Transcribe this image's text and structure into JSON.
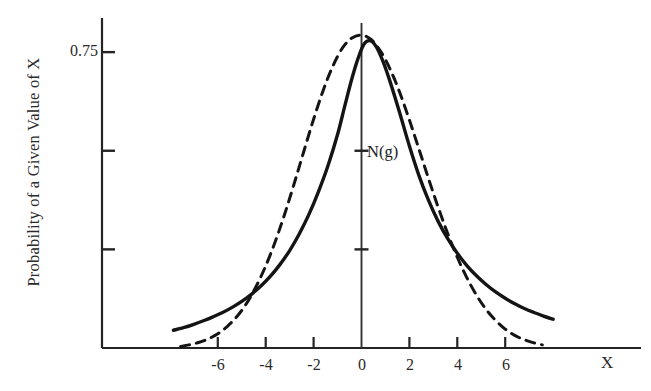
{
  "figure": {
    "background": "#ffffff",
    "ink_color": "#141414"
  },
  "chart_data": {
    "type": "line",
    "title": "",
    "subtitle": "",
    "xlabel": "X",
    "ylabel": "Probability of a Given Value of X",
    "xlim": [
      -7.9,
      11.6
    ],
    "ylim": [
      0,
      0.855
    ],
    "grid": false,
    "legend_position": "none",
    "annotations": [
      {
        "text": "N(g)",
        "x": 0.25,
        "y": 0.495
      }
    ],
    "x_ticks": [
      -6,
      -4,
      -2,
      0,
      2,
      4,
      6
    ],
    "x_tick_labels": [
      "-6",
      "-4",
      "-2",
      "0",
      "2",
      "4",
      "6"
    ],
    "y_ticks": [
      0.25,
      0.5,
      0.75
    ],
    "y_tick_labels": [
      "",
      "",
      "0.75"
    ],
    "y_axis_inner_ticks": [
      0.25,
      0.5,
      0.75
    ],
    "series": [
      {
        "name": "N(g)",
        "style": "solid",
        "color": "#141414",
        "width": 3.4,
        "x": [
          -7.85,
          -7.4,
          -7.0,
          -6.6,
          -6.2,
          -5.8,
          -5.4,
          -5.0,
          -4.6,
          -4.2,
          -3.8,
          -3.4,
          -3.0,
          -2.6,
          -2.2,
          -1.8,
          -1.4,
          -1.0,
          -0.7,
          -0.4,
          -0.15,
          0.1,
          0.35,
          0.6,
          0.9,
          1.2,
          1.6,
          2.0,
          2.4,
          2.8,
          3.2,
          3.6,
          4.0,
          4.4,
          4.8,
          5.2,
          5.6,
          6.0,
          6.4,
          6.8,
          7.2,
          7.6,
          8.0
        ],
        "y": [
          0.045,
          0.052,
          0.06,
          0.069,
          0.079,
          0.09,
          0.103,
          0.118,
          0.136,
          0.157,
          0.182,
          0.212,
          0.247,
          0.289,
          0.338,
          0.396,
          0.462,
          0.541,
          0.613,
          0.683,
          0.733,
          0.77,
          0.779,
          0.765,
          0.726,
          0.674,
          0.595,
          0.512,
          0.437,
          0.374,
          0.321,
          0.277,
          0.24,
          0.209,
          0.183,
          0.161,
          0.142,
          0.126,
          0.112,
          0.1,
          0.09,
          0.081,
          0.073
        ]
      },
      {
        "name": "Gaussian",
        "style": "dashed",
        "color": "#141414",
        "width": 3.0,
        "dash": "9,7",
        "x": [
          -7.55,
          -7.2,
          -6.8,
          -6.4,
          -6.0,
          -5.6,
          -5.2,
          -4.8,
          -4.4,
          -4.0,
          -3.6,
          -3.2,
          -2.8,
          -2.4,
          -2.0,
          -1.6,
          -1.2,
          -0.8,
          -0.4,
          0.0,
          0.4,
          0.8,
          1.2,
          1.6,
          2.0,
          2.4,
          2.8,
          3.2,
          3.6,
          4.0,
          4.4,
          4.8,
          5.2,
          5.6,
          6.0,
          6.4,
          6.8,
          7.2,
          7.55
        ],
        "y": [
          0.004,
          0.008,
          0.014,
          0.023,
          0.036,
          0.055,
          0.08,
          0.113,
          0.156,
          0.208,
          0.27,
          0.341,
          0.419,
          0.5,
          0.58,
          0.653,
          0.714,
          0.76,
          0.786,
          0.793,
          0.782,
          0.752,
          0.706,
          0.647,
          0.578,
          0.504,
          0.429,
          0.357,
          0.29,
          0.23,
          0.178,
          0.134,
          0.098,
          0.07,
          0.048,
          0.032,
          0.021,
          0.013,
          0.008
        ]
      }
    ]
  },
  "axis": {
    "y_axis_label_text": "Probability of a Given Value of X",
    "x_axis_label_text": "X",
    "y_tick_075": "0.75",
    "x_tick_m6": "-6",
    "x_tick_m4": "-4",
    "x_tick_m2": "-2",
    "x_tick_0": "0",
    "x_tick_2": "2",
    "x_tick_4": "4",
    "x_tick_6": "6",
    "curve_annotation": "N(g)"
  }
}
